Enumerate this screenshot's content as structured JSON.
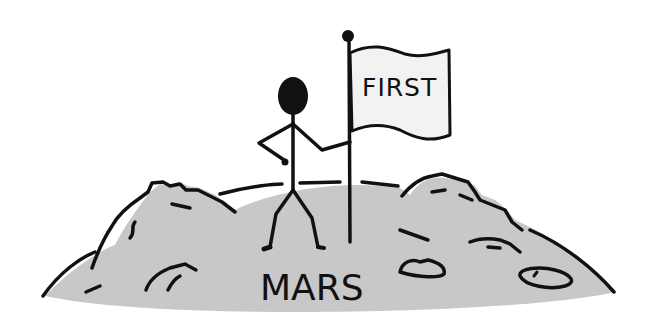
{
  "illustration": {
    "description": "Stick figure planting a flag on Mars",
    "flag_text": "FIRST",
    "ground_label": "MARS",
    "colors": {
      "background": "#ffffff",
      "ground": "#c8c8c8",
      "flag": "#f2f2f2",
      "ink": "#111111"
    }
  }
}
